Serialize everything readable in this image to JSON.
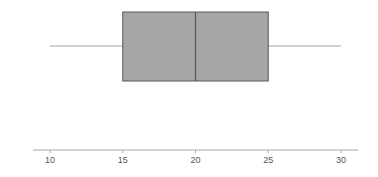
{
  "chart_data": {
    "type": "boxplot",
    "title": "",
    "xlabel": "",
    "ylabel": "",
    "xlim": [
      10,
      30
    ],
    "x_ticks": [
      10,
      15,
      20,
      25,
      30
    ],
    "x_tick_labels": [
      "10",
      "15",
      "20",
      "25",
      "30"
    ],
    "grid": false,
    "orientation": "horizontal",
    "series": [
      {
        "name": "",
        "min": 10,
        "q1": 15,
        "median": 20,
        "q3": 25,
        "max": 30
      }
    ]
  },
  "colors": {
    "box_fill": "#a6a6a6",
    "box_stroke": "#595959",
    "whisker": "#a6a6a6",
    "axis": "#a6a6a6",
    "tick_label": "#595959"
  }
}
